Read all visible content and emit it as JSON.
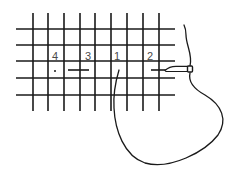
{
  "diagram": {
    "title": "",
    "grid": {
      "vertical_x": [
        33,
        48,
        64,
        80,
        95,
        111,
        127,
        143,
        159
      ],
      "vertical_y_range": [
        13,
        111
      ],
      "horizontal_y": [
        29,
        45,
        61,
        78,
        95
      ],
      "horizontal_x_range": [
        16,
        175
      ],
      "line_color": "#1a1a1a"
    },
    "labels": [
      {
        "text": "4",
        "x": 55,
        "y": 56
      },
      {
        "text": "3",
        "x": 88,
        "y": 56
      },
      {
        "text": "1",
        "x": 117,
        "y": 56
      },
      {
        "text": "2",
        "x": 150,
        "y": 56
      }
    ],
    "points": {
      "point_4": {
        "x": 55,
        "y": 71
      },
      "stitch_3": {
        "x1": 68,
        "y1": 70,
        "x2": 89,
        "y2": 70
      },
      "point_1": {
        "x": 119,
        "y": 70
      },
      "stitch_2": {
        "x1": 151,
        "y1": 70,
        "x2": 166,
        "y2": 70
      }
    },
    "needle": {
      "tip_x": 165,
      "eye_x": 190,
      "y": 69
    },
    "thread_color": "#1a1a1a",
    "label_color": "#4a4a4a"
  }
}
